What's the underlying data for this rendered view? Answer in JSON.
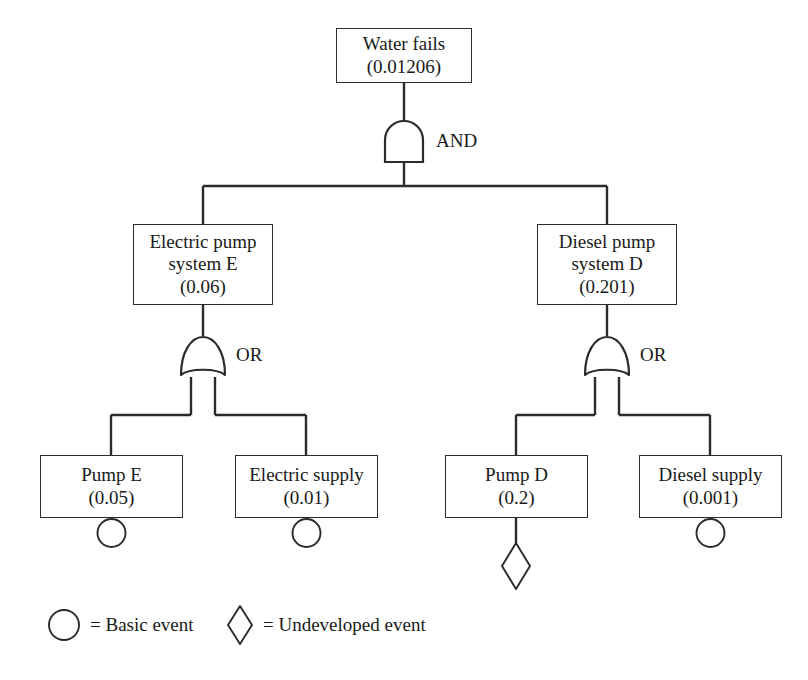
{
  "diagram": {
    "type": "fault-tree",
    "stroke_color": "#2b2b2b",
    "background_color": "#ffffff"
  },
  "nodes": {
    "top": {
      "label": "Water fails",
      "probability": "(0.01206)"
    },
    "electric_pump": {
      "label_line1": "Electric pump",
      "label_line2": "system E",
      "probability": "(0.06)"
    },
    "diesel_pump": {
      "label_line1": "Diesel pump",
      "label_line2": "system D",
      "probability": "(0.201)"
    },
    "pump_e": {
      "label": "Pump E",
      "probability": "(0.05)"
    },
    "electric_supply": {
      "label": "Electric supply",
      "probability": "(0.01)"
    },
    "pump_d": {
      "label": "Pump D",
      "probability": "(0.2)"
    },
    "diesel_supply": {
      "label": "Diesel supply",
      "probability": "(0.001)"
    }
  },
  "gates": {
    "top_gate": {
      "label": "AND",
      "kind": "and-gate"
    },
    "electric_gate": {
      "label": "OR",
      "kind": "or-gate"
    },
    "diesel_gate": {
      "label": "OR",
      "kind": "or-gate"
    }
  },
  "symbols": {
    "pump_e_event": "basic-event-circle",
    "electric_supply_event": "basic-event-circle",
    "pump_d_event": "undeveloped-event-diamond",
    "diesel_supply_event": "basic-event-circle"
  },
  "legend": {
    "basic": {
      "symbol": "circle",
      "text": "= Basic event"
    },
    "undeveloped": {
      "symbol": "diamond",
      "text": "= Undeveloped event"
    }
  }
}
